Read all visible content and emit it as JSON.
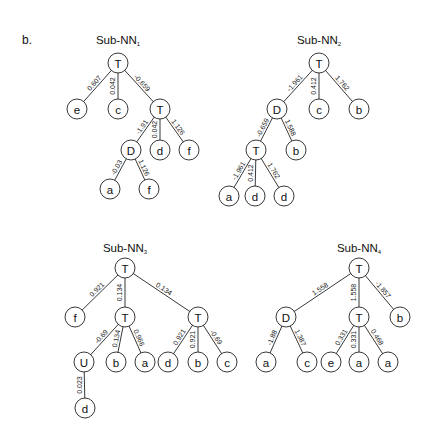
{
  "panel_label": "b.",
  "node_radius": 10,
  "trees": [
    {
      "title": "Sub-NN",
      "subscript": "1",
      "title_pos": [
        118,
        44
      ],
      "nodes": [
        {
          "id": "t1r",
          "label": "T",
          "x": 118,
          "y": 63
        },
        {
          "id": "t1e",
          "label": "e",
          "x": 77,
          "y": 109
        },
        {
          "id": "t1c",
          "label": "c",
          "x": 118,
          "y": 109
        },
        {
          "id": "t1t",
          "label": "T",
          "x": 160,
          "y": 109
        },
        {
          "id": "t1D",
          "label": "D",
          "x": 131,
          "y": 150
        },
        {
          "id": "t1d",
          "label": "d",
          "x": 160,
          "y": 150
        },
        {
          "id": "t1f",
          "label": "f",
          "x": 189,
          "y": 150
        },
        {
          "id": "t1a",
          "label": "a",
          "x": 110,
          "y": 189
        },
        {
          "id": "t1f2",
          "label": "f",
          "x": 149,
          "y": 189
        }
      ],
      "edges": [
        {
          "from": "t1r",
          "to": "t1e",
          "weight": "0.607"
        },
        {
          "from": "t1r",
          "to": "t1c",
          "weight": "0.042"
        },
        {
          "from": "t1r",
          "to": "t1t",
          "weight": "-0.659"
        },
        {
          "from": "t1t",
          "to": "t1D",
          "weight": "-1.91"
        },
        {
          "from": "t1t",
          "to": "t1d",
          "weight": "0.042"
        },
        {
          "from": "t1t",
          "to": "t1f",
          "weight": "1.126"
        },
        {
          "from": "t1D",
          "to": "t1a",
          "weight": "-0.03"
        },
        {
          "from": "t1D",
          "to": "t1f2",
          "weight": "1.126"
        }
      ]
    },
    {
      "title": "Sub-NN",
      "subscript": "2",
      "title_pos": [
        319,
        44
      ],
      "nodes": [
        {
          "id": "t2r",
          "label": "T",
          "x": 319,
          "y": 63
        },
        {
          "id": "t2D",
          "label": "D",
          "x": 277,
          "y": 109
        },
        {
          "id": "t2c",
          "label": "c",
          "x": 319,
          "y": 109
        },
        {
          "id": "t2b",
          "label": "b",
          "x": 359,
          "y": 109
        },
        {
          "id": "t2t",
          "label": "T",
          "x": 256,
          "y": 150
        },
        {
          "id": "t2b2",
          "label": "b",
          "x": 296,
          "y": 150
        },
        {
          "id": "t2a",
          "label": "a",
          "x": 229,
          "y": 196
        },
        {
          "id": "t2d",
          "label": "d",
          "x": 255,
          "y": 196
        },
        {
          "id": "t2d2",
          "label": "d",
          "x": 284,
          "y": 196
        }
      ],
      "edges": [
        {
          "from": "t2r",
          "to": "t2D",
          "weight": "-1.961"
        },
        {
          "from": "t2r",
          "to": "t2c",
          "weight": "0.412"
        },
        {
          "from": "t2r",
          "to": "t2b",
          "weight": "1.762"
        },
        {
          "from": "t2D",
          "to": "t2t",
          "weight": "-0.659"
        },
        {
          "from": "t2D",
          "to": "t2b2",
          "weight": "1.588"
        },
        {
          "from": "t2t",
          "to": "t2a",
          "weight": "-1.961"
        },
        {
          "from": "t2t",
          "to": "t2d",
          "weight": "0.412"
        },
        {
          "from": "t2t",
          "to": "t2d2",
          "weight": "1.762"
        }
      ]
    },
    {
      "title": "Sub-NN",
      "subscript": "3",
      "title_pos": [
        125,
        252
      ],
      "nodes": [
        {
          "id": "t3r",
          "label": "T",
          "x": 125,
          "y": 268
        },
        {
          "id": "t3f",
          "label": "f",
          "x": 75,
          "y": 317
        },
        {
          "id": "t3t",
          "label": "T",
          "x": 125,
          "y": 317
        },
        {
          "id": "t3t2",
          "label": "T",
          "x": 198,
          "y": 317
        },
        {
          "id": "t3U",
          "label": "U",
          "x": 84,
          "y": 362
        },
        {
          "id": "t3b",
          "label": "b",
          "x": 116,
          "y": 362
        },
        {
          "id": "t3a",
          "label": "a",
          "x": 145,
          "y": 362
        },
        {
          "id": "t3d",
          "label": "d",
          "x": 168,
          "y": 362
        },
        {
          "id": "t3b2",
          "label": "b",
          "x": 198,
          "y": 362
        },
        {
          "id": "t3c",
          "label": "c",
          "x": 227,
          "y": 362
        },
        {
          "id": "t3d2",
          "label": "d",
          "x": 85,
          "y": 408
        }
      ],
      "edges": [
        {
          "from": "t3r",
          "to": "t3f",
          "weight": "0.921"
        },
        {
          "from": "t3r",
          "to": "t3t",
          "weight": "0.134"
        },
        {
          "from": "t3r",
          "to": "t3t2",
          "weight": "0.134"
        },
        {
          "from": "t3t",
          "to": "t3U",
          "weight": "-0.69"
        },
        {
          "from": "t3t",
          "to": "t3b",
          "weight": "0.134"
        },
        {
          "from": "t3t",
          "to": "t3a",
          "weight": "0.966"
        },
        {
          "from": "t3t2",
          "to": "t3d",
          "weight": "0.921"
        },
        {
          "from": "t3t2",
          "to": "t3b2",
          "weight": "0.921"
        },
        {
          "from": "t3t2",
          "to": "t3c",
          "weight": "-0.69"
        },
        {
          "from": "t3U",
          "to": "t3d2",
          "weight": "0.023"
        }
      ]
    },
    {
      "title": "Sub-NN",
      "subscript": "4",
      "title_pos": [
        359,
        252
      ],
      "nodes": [
        {
          "id": "t4r",
          "label": "T",
          "x": 359,
          "y": 268
        },
        {
          "id": "t4D",
          "label": "D",
          "x": 286,
          "y": 317
        },
        {
          "id": "t4t",
          "label": "T",
          "x": 359,
          "y": 317
        },
        {
          "id": "t4b",
          "label": "b",
          "x": 400,
          "y": 317
        },
        {
          "id": "t4a",
          "label": "a",
          "x": 266,
          "y": 362
        },
        {
          "id": "t4c",
          "label": "c",
          "x": 307,
          "y": 362
        },
        {
          "id": "t4e",
          "label": "e",
          "x": 331,
          "y": 362
        },
        {
          "id": "t4a2",
          "label": "a",
          "x": 359,
          "y": 362
        },
        {
          "id": "t4a3",
          "label": "a",
          "x": 388,
          "y": 362
        }
      ],
      "edges": [
        {
          "from": "t4r",
          "to": "t4D",
          "weight": "1.558"
        },
        {
          "from": "t4r",
          "to": "t4t",
          "weight": "1.558"
        },
        {
          "from": "t4r",
          "to": "t4b",
          "weight": "-1.857"
        },
        {
          "from": "t4D",
          "to": "t4a",
          "weight": "-1.88"
        },
        {
          "from": "t4D",
          "to": "t4c",
          "weight": "1.387"
        },
        {
          "from": "t4t",
          "to": "t4e",
          "weight": "0.331"
        },
        {
          "from": "t4t",
          "to": "t4a2",
          "weight": "0.331"
        },
        {
          "from": "t4t",
          "to": "t4a3",
          "weight": "0.468"
        }
      ]
    }
  ]
}
